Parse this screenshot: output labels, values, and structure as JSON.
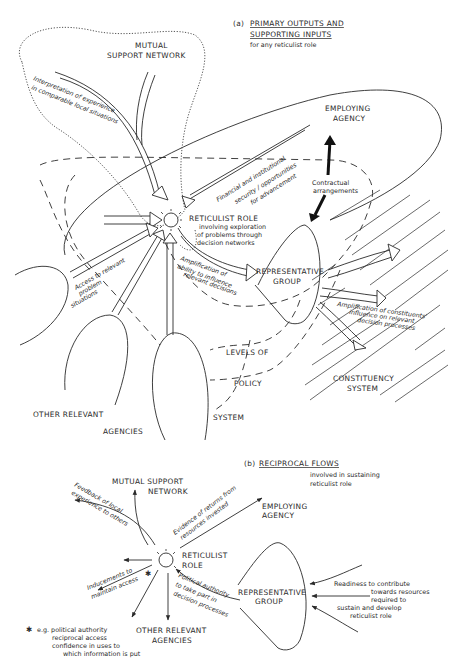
{
  "part_a": {
    "caption_prefix": "(a)",
    "caption_line1": "PRIMARY OUTPUTS AND",
    "caption_line2": "SUPPORTING INPUTS",
    "caption_sub": "for any reticulist role",
    "nodes": {
      "mutual_support_1": "MUTUAL",
      "mutual_support_2": "SUPPORT NETWORK",
      "employing_1": "EMPLOYING",
      "employing_2": "AGENCY",
      "reticulist": "RETICULIST ROLE",
      "reticulist_sub1": "involving exploration",
      "reticulist_sub2": "of problems through",
      "reticulist_sub3": "decision networks",
      "rep_group_1": "REPRESENTATIVE",
      "rep_group_2": "GROUP",
      "levels_1": "LEVELS OF",
      "levels_2": "POLICY",
      "levels_3": "SYSTEM",
      "other_1": "OTHER RELEVANT",
      "other_2": "AGENCIES",
      "constituency_1": "CONSTITUENCY",
      "constituency_2": "SYSTEM"
    },
    "flows": {
      "interpretation_1": "Interpretation of experience",
      "interpretation_2": "in comparable local situations",
      "financial_1": "Financial and institutional",
      "financial_2": "security / opportunities",
      "financial_3": "for advancement",
      "contractual_1": "Contractual",
      "contractual_2": "arrangements",
      "access_1": "Access to relevant",
      "access_2": "problem",
      "access_3": "situations",
      "amplification_1": "Amplification of",
      "amplification_2": "ability to influence",
      "amplification_3": "relevant decisions",
      "constituents_1": "Amplification of constituents'",
      "constituents_2": "influence on relevant",
      "constituents_3": "decision processes"
    }
  },
  "part_b": {
    "caption_prefix": "(b)",
    "caption_line1": "RECIPROCAL FLOWS",
    "caption_sub1": "involved in sustaining",
    "caption_sub2": "reticulist role",
    "nodes": {
      "mutual_1": "MUTUAL SUPPORT",
      "mutual_2": "NETWORK",
      "employing_1": "EMPLOYING",
      "employing_2": "AGENCY",
      "reticulist_1": "RETICULIST",
      "reticulist_2": "ROLE",
      "rep_group_1": "REPRESENTATIVE",
      "rep_group_2": "GROUP",
      "other_1": "OTHER RELEVANT",
      "other_2": "AGENCIES"
    },
    "flows": {
      "feedback_1": "Feedback of local",
      "feedback_2": "experience to others",
      "evidence_1": "Evidence of returns from",
      "evidence_2": "resources invested",
      "inducements_1": "Inducements to",
      "inducements_2": "maintain access",
      "political_1": "Political authority",
      "political_2": "to take part in",
      "political_3": "decision processes",
      "readiness_1": "Readiness to contribute",
      "readiness_2": "towards resources",
      "readiness_3": "required to",
      "readiness_4": "sustain and develop",
      "readiness_5": "reticulist role"
    },
    "footnote": {
      "marker": "✱",
      "line1": "e.g. political authority",
      "line2": "reciprocal access",
      "line3": "confidence in uses to",
      "line4": "which information is put"
    }
  }
}
